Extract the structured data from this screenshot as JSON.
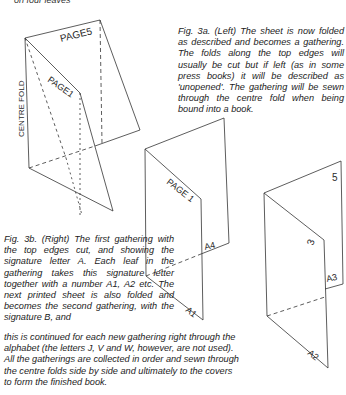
{
  "top_fragment": "on four leaves",
  "figures": {
    "fig3a": {
      "labels": {
        "centre_fold": "CENTRE FOLD",
        "page5": "PAGE5",
        "page1": "PAGE1"
      },
      "caption": "Fig. 3a. (Left) The sheet is now folded as described and becomes a gathering. The folds along the top edges will usually be cut but if left (as in some press books) it will be described as 'unopened'. The gathering will be sewn through the centre fold when being bound into a book."
    },
    "fig3b_middle": {
      "labels": {
        "page1": "PAGE 1",
        "a4": "A4",
        "a1": "A1"
      }
    },
    "fig3b_right": {
      "labels": {
        "five": "5",
        "three": "3",
        "a3": "A3",
        "a2": "A2"
      }
    },
    "fig3b": {
      "caption_part1": "Fig. 3b. (Right) The first gathering with the top edges cut, and showing the signature letter A. Each leaf in the gathering takes this signature letter together with a number A1, A2 etc. The next printed sheet is also folded and becomes the second gathering, with the signature B, and",
      "caption_lines": [
        "this is continued for each new gathering right through the",
        "alphabet (the letters J, V and W, however, are not used).",
        "All the gatherings are collected in order and sewn through",
        "the centre folds side by side and ultimately to the covers",
        "to form the finished book."
      ]
    }
  }
}
